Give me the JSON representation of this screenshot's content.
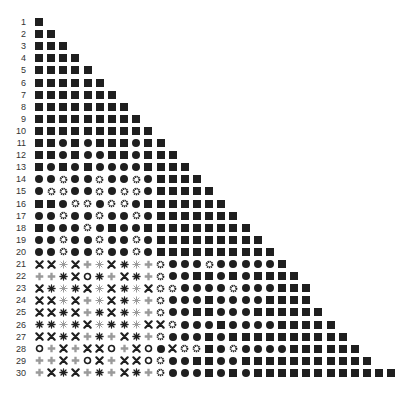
{
  "figure": {
    "title": "",
    "legend_codes": {
      "S": "filled-square",
      "C": "filled-circle",
      "G": "gear-ring",
      "X": "cross",
      "P": "plus",
      "A": "dark-asterisk",
      "L": "light-asterisk",
      "O": "open-ring"
    },
    "colors": {
      "ink": "#1f1f1f",
      "light": "#9a9a9a",
      "label": "#333333"
    },
    "rows": [
      {
        "label": "1",
        "symbols": "S"
      },
      {
        "label": "2",
        "symbols": "SS"
      },
      {
        "label": "3",
        "symbols": "SSS"
      },
      {
        "label": "4",
        "symbols": "SSSS"
      },
      {
        "label": "5",
        "symbols": "SSSSS"
      },
      {
        "label": "6",
        "symbols": "SSSSSS"
      },
      {
        "label": "7",
        "symbols": "SSSSSSS"
      },
      {
        "label": "8",
        "symbols": "SSSSSSSS"
      },
      {
        "label": "9",
        "symbols": "SSSSSSSSS"
      },
      {
        "label": "10",
        "symbols": "SSSSSSSSSS"
      },
      {
        "label": "11",
        "symbols": "SSCSCSSSCSS"
      },
      {
        "label": "12",
        "symbols": "SSCSCCSSCSSS"
      },
      {
        "label": "13",
        "symbols": "SCSCSCCCCSSSS"
      },
      {
        "label": "14",
        "symbols": "CCGCCGCCGCSSSS"
      },
      {
        "label": "15",
        "symbols": "CGGCCGCGGCSSSSS"
      },
      {
        "label": "16",
        "symbols": "SSCGGCGGCSSSSSSS"
      },
      {
        "label": "17",
        "symbols": "CCGCCGCCGCSSSSSSS"
      },
      {
        "label": "18",
        "symbols": "SCCCGCSCCSSSSSSSSS"
      },
      {
        "label": "19",
        "symbols": "CCGCCGCCGCSSSSSSSSS"
      },
      {
        "label": "20",
        "symbols": "CCGCCGCCGCSSSSSSSSSS"
      },
      {
        "label": "21",
        "symbols": "XXLXPLXALPGCCCGCCCCCS"
      },
      {
        "label": "22",
        "symbols": "PPAXOAPXAPGCCSSCSCSSSS"
      },
      {
        "label": "23",
        "symbols": "XALAXLXALXGGCCCCGCCCSSS"
      },
      {
        "label": "24",
        "symbols": "XXLXPLXALPGCCCSCCCCSSSS"
      },
      {
        "label": "25",
        "symbols": "XXAXPAXALPGCCSSCCCSSSSSS"
      },
      {
        "label": "26",
        "symbols": "AALAXLAALXXGCCCSCCCCSSSSS"
      },
      {
        "label": "27",
        "symbols": "XXAXPAPXAPGCCCSCSSSSSSSSSS"
      },
      {
        "label": "28",
        "symbols": "OPXPXXOPXOCXGGSCGCCCCSSSSSS"
      },
      {
        "label": "29",
        "symbols": "PPXPOXPXXOGCCSSCCSSSSSSSSSSS"
      },
      {
        "label": "30",
        "symbols": "PXAXPAPXAPGCCCSCSCSSSSSSSSSSSS"
      }
    ]
  }
}
